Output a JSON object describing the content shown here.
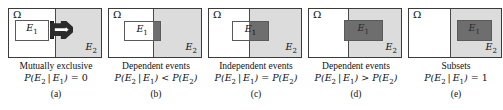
{
  "figure": {
    "colors": {
      "e2_fill": "#dcdcdc",
      "intersection_fill": "#6e6e6e",
      "outline": "#3b3b3b",
      "background": "#ffffff"
    },
    "symbols": {
      "omega": "Ω",
      "e1": "E",
      "e1_sub": "1",
      "e2": "E",
      "e2_sub": "2"
    },
    "panels": [
      {
        "id": "a",
        "letter": "(a)",
        "title": "Mutually exclusive",
        "formula_parts": {
          "p_open": "P(",
          "arg": "E₂ | E₁",
          "p_close": ")",
          "relation": "=",
          "rhs": "0"
        },
        "formula": "P(E2 | E1) = 0",
        "omega_label": "Ω",
        "e1_label": "E1",
        "e2_label": "E2",
        "e2_left_pct": 50,
        "e1": {
          "left_pct": 6,
          "top_pct": 22,
          "width_pct": 38,
          "height_pct": 44,
          "filled": false
        },
        "intersection": null,
        "arrow": {
          "left_pct": 45,
          "top_pct": 26,
          "width_pct": 25,
          "height_pct": 36
        }
      },
      {
        "id": "b",
        "letter": "(b)",
        "title": "Dependent events",
        "formula_parts": {
          "p_open": "P(",
          "arg": "E₂ | E₁",
          "p_close": ")",
          "relation": "<",
          "rhs": "P(E₂)"
        },
        "formula": "P(E2 | E1) < P(E2)",
        "omega_label": "Ω",
        "e1_label": "E1",
        "e2_label": "E2",
        "e2_left_pct": 48,
        "e1": {
          "left_pct": 16,
          "top_pct": 24,
          "width_pct": 40,
          "height_pct": 42,
          "filled": false
        },
        "intersection": {
          "left_pct": 48,
          "top_pct": 24,
          "width_pct": 8,
          "height_pct": 42
        },
        "arrow": null
      },
      {
        "id": "c",
        "letter": "(c)",
        "title": "Independent events",
        "formula_parts": {
          "p_open": "P(",
          "arg": "E₂ | E₁",
          "p_close": ")",
          "relation": "=",
          "rhs": "P(E₂)"
        },
        "formula": "P(E2 | E1) = P(E2)",
        "omega_label": "Ω",
        "e1_label": "E1",
        "e2_label": "E2",
        "e2_left_pct": 44,
        "e1": {
          "left_pct": 25,
          "top_pct": 24,
          "width_pct": 40,
          "height_pct": 42,
          "filled": false
        },
        "intersection": {
          "left_pct": 44,
          "top_pct": 24,
          "width_pct": 21,
          "height_pct": 42
        },
        "arrow": null
      },
      {
        "id": "d",
        "letter": "(d)",
        "title": "Dependent events",
        "formula_parts": {
          "p_open": "P(",
          "arg": "E₂ | E₁",
          "p_close": ")",
          "relation": ">",
          "rhs": "P(E₂)"
        },
        "formula": "P(E2 | E1) > P(E2)",
        "omega_label": "Ω",
        "e1_label": "E1",
        "e2_label": "E2",
        "e2_left_pct": 42,
        "e1": {
          "left_pct": 38,
          "top_pct": 22,
          "width_pct": 42,
          "height_pct": 44,
          "filled": true
        },
        "intersection": {
          "left_pct": 42,
          "top_pct": 22,
          "width_pct": 38,
          "height_pct": 44
        },
        "arrow": null
      },
      {
        "id": "e",
        "letter": "(e)",
        "title": "Subsets",
        "formula_parts": {
          "p_open": "P(",
          "arg": "E₂ | E₁",
          "p_close": ")",
          "relation": "=",
          "rhs": "1"
        },
        "formula": "P(E2 | E1) = 1",
        "omega_label": "Ω",
        "e1_label": "E1",
        "e2_label": "E2",
        "e2_left_pct": 45,
        "e1": {
          "left_pct": 52,
          "top_pct": 22,
          "width_pct": 38,
          "height_pct": 44,
          "filled": true
        },
        "intersection": null,
        "arrow": null
      }
    ]
  }
}
